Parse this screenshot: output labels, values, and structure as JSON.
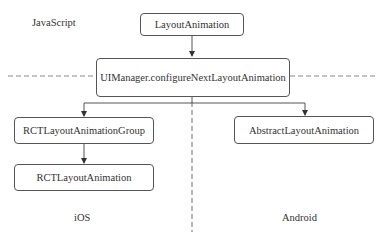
{
  "diagram": {
    "regions": {
      "javascript": "JavaScript",
      "ios": "iOS",
      "android": "Android"
    },
    "nodes": {
      "layout_animation": "LayoutAnimation",
      "ui_manager": "UIManager.configureNextLayoutAnimation",
      "rct_group": "RCTLayoutAnimationGroup",
      "rct_animation": "RCTLayoutAnimation",
      "abstract_animation": "AbstractLayoutAnimation"
    },
    "edges": [
      {
        "from": "LayoutAnimation",
        "to": "UIManager.configureNextLayoutAnimation"
      },
      {
        "from": "UIManager.configureNextLayoutAnimation",
        "to": "RCTLayoutAnimationGroup"
      },
      {
        "from": "UIManager.configureNextLayoutAnimation",
        "to": "AbstractLayoutAnimation"
      },
      {
        "from": "RCTLayoutAnimationGroup",
        "to": "RCTLayoutAnimation"
      }
    ],
    "colors": {
      "line": "#555555",
      "dash": "#888888",
      "text": "#333333"
    }
  }
}
